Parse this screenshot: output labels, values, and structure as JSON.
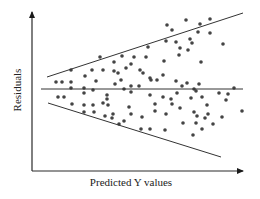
{
  "chart_data": {
    "type": "scatter",
    "title": "",
    "xlabel": "Predicted Y values",
    "ylabel": "Residuals",
    "grid": false,
    "legend": null,
    "axis_ticks": "none",
    "annotations": [
      "horizontal zero-residual reference line",
      "upper funnel boundary line widening to the right",
      "lower funnel boundary line widening to the right"
    ],
    "pattern": "heteroscedastic funnel (residual spread increases with predicted Y)",
    "colors": {
      "axis": "#2a2a2a",
      "points": "#444444",
      "lines": "#333333"
    },
    "geometry": {
      "y_axis": {
        "x": 32,
        "y_top": 12,
        "y_bottom": 171
      },
      "x_axis": {
        "y": 171,
        "x_left": 32,
        "x_right": 243
      },
      "zero_line": {
        "y": 89,
        "x1": 41,
        "x2": 243
      },
      "upper_band": {
        "x1": 47,
        "y1": 77,
        "x2": 243,
        "y2": 13
      },
      "lower_band": {
        "x1": 48,
        "y1": 103,
        "x2": 221,
        "y2": 157
      }
    },
    "points": [
      [
        56,
        82
      ],
      [
        62,
        82
      ],
      [
        71,
        82
      ],
      [
        71,
        70
      ],
      [
        100,
        57
      ],
      [
        85,
        76
      ],
      [
        92,
        70
      ],
      [
        103,
        70
      ],
      [
        96,
        81
      ],
      [
        58,
        97
      ],
      [
        64,
        97
      ],
      [
        71,
        88
      ],
      [
        84,
        88
      ],
      [
        84,
        93
      ],
      [
        93,
        90
      ],
      [
        72,
        104
      ],
      [
        84,
        105
      ],
      [
        93,
        105
      ],
      [
        107,
        99
      ],
      [
        121,
        80
      ],
      [
        118,
        73
      ],
      [
        114,
        62
      ],
      [
        114,
        71
      ],
      [
        126,
        68
      ],
      [
        131,
        64
      ],
      [
        140,
        70
      ],
      [
        107,
        95
      ],
      [
        124,
        89
      ],
      [
        131,
        86
      ],
      [
        139,
        86
      ],
      [
        129,
        107
      ],
      [
        131,
        92
      ],
      [
        143,
        73
      ],
      [
        150,
        78
      ],
      [
        150,
        95
      ],
      [
        115,
        84
      ],
      [
        122,
        56
      ],
      [
        134,
        57
      ],
      [
        146,
        57
      ],
      [
        151,
        80
      ],
      [
        148,
        47
      ],
      [
        164,
        61
      ],
      [
        166,
        41
      ],
      [
        176,
        42
      ],
      [
        179,
        55
      ],
      [
        172,
        30
      ],
      [
        190,
        39
      ],
      [
        188,
        50
      ],
      [
        167,
        25
      ],
      [
        180,
        48
      ],
      [
        192,
        43
      ],
      [
        198,
        32
      ],
      [
        201,
        62
      ],
      [
        200,
        24
      ],
      [
        210,
        33
      ],
      [
        210,
        19
      ],
      [
        223,
        44
      ],
      [
        186,
        20
      ],
      [
        163,
        75
      ],
      [
        157,
        80
      ],
      [
        177,
        93
      ],
      [
        176,
        81
      ],
      [
        187,
        83
      ],
      [
        199,
        84
      ],
      [
        182,
        86
      ],
      [
        194,
        89
      ],
      [
        202,
        97
      ],
      [
        163,
        97
      ],
      [
        171,
        99
      ],
      [
        155,
        104
      ],
      [
        155,
        111
      ],
      [
        166,
        114
      ],
      [
        180,
        108
      ],
      [
        194,
        112
      ],
      [
        208,
        114
      ],
      [
        197,
        116
      ],
      [
        207,
        105
      ],
      [
        196,
        91
      ],
      [
        219,
        93
      ],
      [
        228,
        94
      ],
      [
        234,
        88
      ],
      [
        213,
        124
      ],
      [
        222,
        117
      ],
      [
        226,
        100
      ],
      [
        242,
        111
      ],
      [
        196,
        123
      ],
      [
        202,
        129
      ],
      [
        193,
        135
      ],
      [
        165,
        130
      ],
      [
        142,
        117
      ],
      [
        141,
        129
      ],
      [
        150,
        129
      ],
      [
        131,
        114
      ],
      [
        124,
        121
      ],
      [
        119,
        124
      ],
      [
        105,
        116
      ],
      [
        112,
        118
      ],
      [
        94,
        112
      ],
      [
        84,
        112
      ],
      [
        103,
        103
      ],
      [
        108,
        105
      ],
      [
        113,
        114
      ],
      [
        191,
        98
      ],
      [
        172,
        104
      ],
      [
        205,
        118
      ],
      [
        183,
        123
      ]
    ]
  },
  "axes": {
    "x_label": "Predicted Y values",
    "y_label": "Residuals"
  }
}
